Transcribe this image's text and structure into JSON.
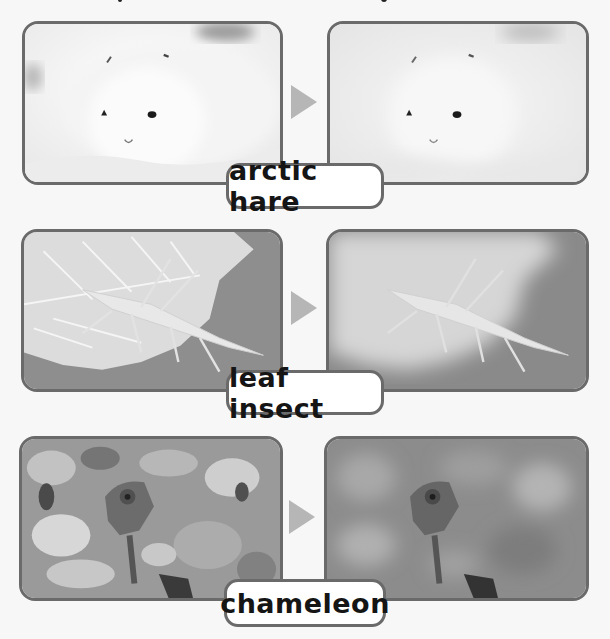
{
  "figure": {
    "colors": {
      "border": "#6a6a6a",
      "arrow": "#b6b6b6",
      "label_bg": "#ffffff",
      "label_text": "#151515",
      "background": "#f7f7f7"
    },
    "rows": [
      {
        "label": "arctic hare",
        "before_image": "arctic hare on snow (original photo)",
        "after_image": "arctic hare with background faded",
        "arrow_icon": "right-triangle-arrow"
      },
      {
        "label": "leaf insect",
        "before_image": "leaf insect on leaf (original photo)",
        "after_image": "leaf insect with leaf faded",
        "arrow_icon": "right-triangle-arrow"
      },
      {
        "label": "chameleon",
        "before_image": "chameleon among foliage (original photo)",
        "after_image": "chameleon with foliage blurred",
        "arrow_icon": "right-triangle-arrow"
      }
    ]
  }
}
